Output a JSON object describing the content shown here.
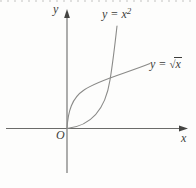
{
  "figure": {
    "background": "#fdfdfc",
    "axis_color": "#6b6b69",
    "arrow_color": "#444442",
    "curve_color": "#8a8a88",
    "label_color": "#3d3d3b",
    "x_axis_label": "x",
    "y_axis_label": "y",
    "origin_label": "O",
    "curves": [
      {
        "id": "parabola",
        "label_base": "y = x",
        "label_sup": "2"
      },
      {
        "id": "sqrt-curve",
        "label_prefix": "y = ",
        "radical_sign": "√",
        "radicand": "x"
      }
    ]
  }
}
